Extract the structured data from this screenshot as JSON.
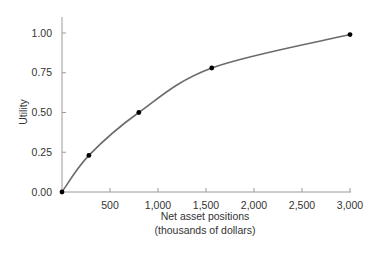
{
  "chart_data": {
    "type": "line",
    "title": "",
    "xlabel": "Net asset positions (thousands of dollars)",
    "xlabel_lines": [
      "Net asset positions",
      "(thousands of dollars)"
    ],
    "ylabel": "Utility",
    "xlim": [
      0,
      3000
    ],
    "ylim": [
      0,
      1.0
    ],
    "x_ticks": [
      500,
      1000,
      1500,
      2000,
      2500,
      3000
    ],
    "x_tick_labels": [
      "500",
      "1,000",
      "1,500",
      "2,000",
      "2,500",
      "3,000"
    ],
    "y_ticks": [
      0,
      0.25,
      0.5,
      0.75,
      1.0
    ],
    "y_tick_labels": [
      "0.00",
      "0.25",
      "0.50",
      "0.75",
      "1.00"
    ],
    "grid": false,
    "legend": null,
    "series": [
      {
        "name": "Utility curve",
        "style": "smooth concave curve with marked points",
        "points": [
          {
            "x": 0,
            "y": 0.0
          },
          {
            "x": 280,
            "y": 0.23
          },
          {
            "x": 800,
            "y": 0.5
          },
          {
            "x": 1560,
            "y": 0.78
          },
          {
            "x": 3000,
            "y": 0.99
          }
        ]
      }
    ]
  },
  "colors": {
    "curve": "#6b6b6b",
    "points": "#000000",
    "axis": "#9a9a9a",
    "text": "#333333"
  }
}
